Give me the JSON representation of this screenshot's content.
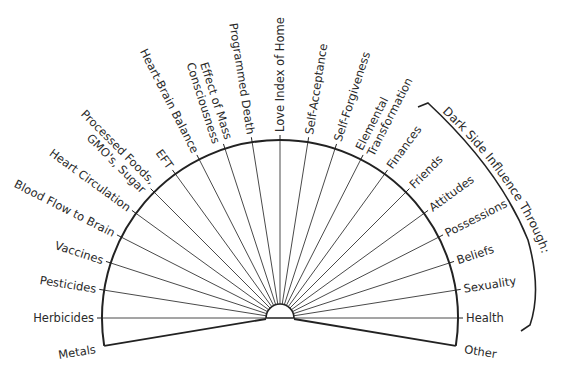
{
  "diagram": {
    "center": [
      280,
      318
    ],
    "hub_radius": 14,
    "arc_radius": 178,
    "label_gap": 6,
    "colors": {
      "line": "#222222",
      "ray": "#4a4a4a",
      "text": "#2a2a2a",
      "background": "#ffffff"
    },
    "edge_left": {
      "label": "Metals",
      "angle": 189
    },
    "edge_right": {
      "label": "Other",
      "angle": -9
    },
    "rays": [
      {
        "label": "Herbicides",
        "angle": 180,
        "lines": [
          "Herbicides"
        ]
      },
      {
        "label": "Pesticides",
        "angle": 171,
        "lines": [
          "Pesticides"
        ]
      },
      {
        "label": "Vaccines",
        "angle": 162,
        "lines": [
          "Vaccines"
        ]
      },
      {
        "label": "Blood Flow to Brain",
        "angle": 153,
        "lines": [
          "Blood Flow to Brain"
        ]
      },
      {
        "label": "Heart Circulation",
        "angle": 144,
        "lines": [
          "Heart Circulation"
        ]
      },
      {
        "label": "Processed Foods, GMO's, Sugar",
        "angle": 135,
        "lines": [
          "Processed Foods,",
          "GMO's, Sugar"
        ]
      },
      {
        "label": "EFT",
        "angle": 126,
        "lines": [
          "EFT"
        ]
      },
      {
        "label": "Heart-Brain Balance",
        "angle": 117,
        "lines": [
          "Heart-Brain Balance"
        ]
      },
      {
        "label": "Effect of Mass Consciousness",
        "angle": 108,
        "lines": [
          "Effect of Mass",
          "Consciousness"
        ]
      },
      {
        "label": "Programmed Death",
        "angle": 99,
        "lines": [
          "Programmed Death"
        ]
      },
      {
        "label": "Love Index of Home",
        "angle": 90,
        "lines": [
          "Love Index of Home"
        ]
      },
      {
        "label": "Self-Acceptance",
        "angle": 81,
        "lines": [
          "Self-Acceptance"
        ]
      },
      {
        "label": "Self-Forgiveness",
        "angle": 72,
        "lines": [
          "Self-Forgiveness"
        ]
      },
      {
        "label": "Elemental Transformation",
        "angle": 63,
        "lines": [
          "Elemental",
          "Transformation"
        ]
      },
      {
        "label": "Finances",
        "angle": 54,
        "lines": [
          "Finances"
        ]
      },
      {
        "label": "Friends",
        "angle": 45,
        "lines": [
          "Friends"
        ]
      },
      {
        "label": "Attitudes",
        "angle": 36,
        "lines": [
          "Attitudes"
        ]
      },
      {
        "label": "Possessions",
        "angle": 27,
        "lines": [
          "Possessions"
        ]
      },
      {
        "label": "Beliefs",
        "angle": 18,
        "lines": [
          "Beliefs"
        ]
      },
      {
        "label": "Sexuality",
        "angle": 9,
        "lines": [
          "Sexuality"
        ]
      },
      {
        "label": "Health",
        "angle": 0,
        "lines": [
          "Health"
        ]
      }
    ],
    "bracket": {
      "label": "Dark Side Influence Through:",
      "path": "M418,107 L428,103 Q500,170 528,240 Q542,290 530,325 L521,331"
    }
  }
}
